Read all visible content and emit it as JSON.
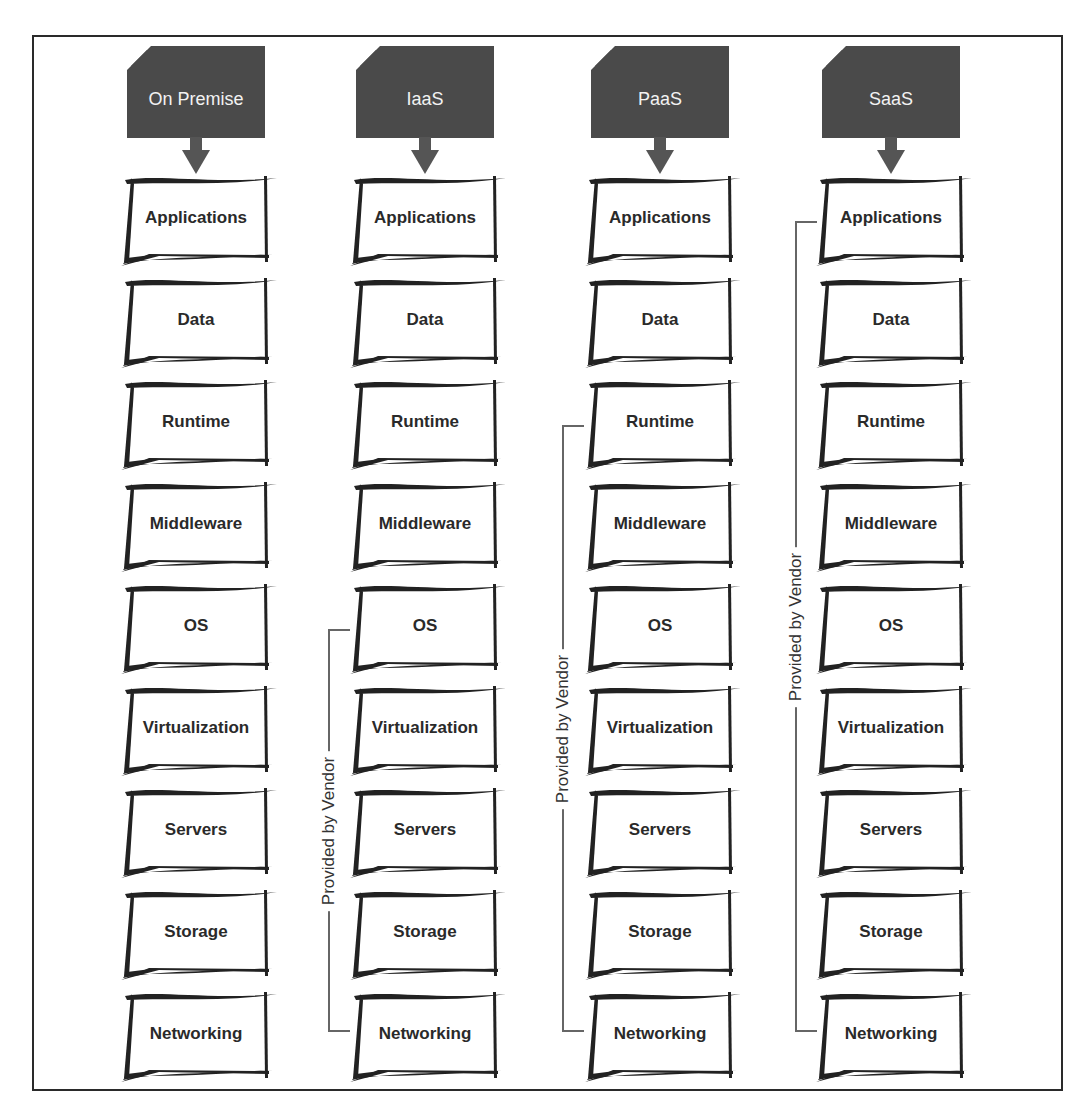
{
  "diagram": {
    "columns": [
      {
        "id": "on-premise",
        "title": "On Premise",
        "layers": [
          "Applications",
          "Data",
          "Runtime",
          "Middleware",
          "OS",
          "Virtualization",
          "Servers",
          "Storage",
          "Networking"
        ],
        "vendor_bracket": null
      },
      {
        "id": "iaas",
        "title": "IaaS",
        "layers": [
          "Applications",
          "Data",
          "Runtime",
          "Middleware",
          "OS",
          "Virtualization",
          "Servers",
          "Storage",
          "Networking"
        ],
        "vendor_bracket": {
          "label": "Provided by Vendor",
          "from": "OS",
          "to": "Networking"
        }
      },
      {
        "id": "paas",
        "title": "PaaS",
        "layers": [
          "Applications",
          "Data",
          "Runtime",
          "Middleware",
          "OS",
          "Virtualization",
          "Servers",
          "Storage",
          "Networking"
        ],
        "vendor_bracket": {
          "label": "Provided by Vendor",
          "from": "Runtime",
          "to": "Networking"
        }
      },
      {
        "id": "saas",
        "title": "SaaS",
        "layers": [
          "Applications",
          "Data",
          "Runtime",
          "Middleware",
          "OS",
          "Virtualization",
          "Servers",
          "Storage",
          "Networking"
        ],
        "vendor_bracket": {
          "label": "Provided by Vendor",
          "from": "Applications",
          "to": "Networking"
        }
      }
    ],
    "colors": {
      "header_bg": "#4a4a4a",
      "header_text": "#f2f2f2",
      "layer_text": "#2a2a2a",
      "bracket_line": "#666666"
    }
  }
}
